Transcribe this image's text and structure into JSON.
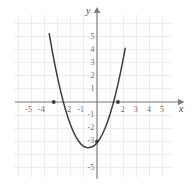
{
  "chart_data": {
    "type": "line",
    "title": "",
    "xlabel": "x",
    "ylabel": "y",
    "xlim": [
      -6.4,
      5.8
    ],
    "ylim": [
      -6.3,
      6.6
    ],
    "grid": true,
    "legend": null,
    "x_ticks": [
      -5,
      -4,
      -2,
      -1,
      2,
      3,
      4,
      5
    ],
    "x_tick_labels": [
      "-5",
      "-4",
      "-2",
      "-1",
      "2",
      "3",
      "4",
      "5"
    ],
    "y_ticks": [
      5,
      4,
      3,
      2,
      1,
      -1,
      -2,
      -3,
      -5
    ],
    "y_tick_labels": [
      "5",
      "4",
      "3",
      "2",
      "1",
      "-1",
      "-2",
      "-3",
      "-5"
    ],
    "curve": {
      "name": "parabola",
      "equation": "y = x^2 + 1.4x - 3",
      "color": "#3c3c3c",
      "vertex": [
        -0.7,
        -4.2
      ],
      "x_intercepts": [
        -3.3,
        1.6
      ],
      "y_intercept": -3,
      "x": [
        -3.65,
        -3.4,
        -3.2,
        -3.0,
        -2.8,
        -2.6,
        -2.4,
        -2.2,
        -2.0,
        -1.8,
        -1.6,
        -1.4,
        -1.2,
        -1.0,
        -0.8,
        -0.7,
        -0.6,
        -0.4,
        -0.2,
        0.0,
        0.2,
        0.4,
        0.6,
        0.8,
        1.0,
        1.2,
        1.4,
        1.6,
        1.8,
        2.0,
        2.15
      ],
      "y": [
        5.22,
        3.8,
        2.76,
        1.8,
        0.92,
        0.12,
        -0.6,
        -1.24,
        -1.8,
        -2.28,
        -2.68,
        -3.0,
        -3.24,
        -3.4,
        -3.48,
        -3.49,
        -3.48,
        -3.44,
        -3.32,
        -3.12,
        -2.84,
        -2.48,
        -2.04,
        -1.52,
        -0.92,
        -0.24,
        0.52,
        1.36,
        2.28,
        3.28,
        4.1
      ]
    },
    "markers": [
      {
        "name": "left-x-intercept",
        "x": -3.3,
        "y": 0
      },
      {
        "name": "right-x-intercept",
        "x": 1.6,
        "y": 0
      },
      {
        "name": "y-intercept",
        "x": 0,
        "y": -3
      }
    ],
    "colors": {
      "grid": "#f0e4e6",
      "axis": "#7d7d7d",
      "curve": "#3c3c3c",
      "text": "#6b6b6b",
      "background": "#ffffff"
    }
  }
}
